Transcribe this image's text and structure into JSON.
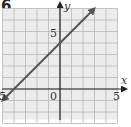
{
  "problem_number": "6",
  "chart_data": {
    "type": "line",
    "title": "",
    "xlabel": "x",
    "ylabel": "y",
    "xlim": [
      -5,
      5
    ],
    "ylim": [
      -3,
      7
    ],
    "grid": true,
    "x_tick_labels": [
      "5",
      "0",
      "5"
    ],
    "x_tick_values": [
      -5,
      0,
      5
    ],
    "y_tick_labels": [
      "5"
    ],
    "y_tick_values": [
      5
    ],
    "series": [
      {
        "name": "line",
        "equation": "y = x + 4",
        "x": [
          -5,
          3
        ],
        "y": [
          -1,
          7
        ],
        "arrows": "both",
        "color": "#555555"
      }
    ]
  },
  "colors": {
    "grid": "#b8b8b8",
    "grid_bg": "#ececec",
    "axis": "#222222",
    "line": "#555555"
  }
}
